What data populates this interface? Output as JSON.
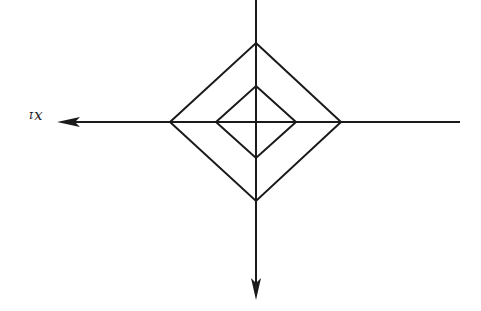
{
  "diagram": {
    "axis_label": "x₁",
    "stroke_color": "#1a1a1a",
    "background": "#ffffff",
    "center": {
      "x": 256,
      "y": 122
    },
    "horizontal_axis": {
      "x1": 460,
      "x2": 57,
      "y": 122,
      "arrow": "left"
    },
    "vertical_axis": {
      "x": 256,
      "y1": 0,
      "y2": 300,
      "arrow": "down"
    },
    "diamonds": [
      {
        "name": "outer",
        "top": [
          256,
          43
        ],
        "right": [
          341,
          122
        ],
        "bottom": [
          256,
          201
        ],
        "left": [
          170,
          122
        ]
      },
      {
        "name": "inner",
        "top": [
          256,
          86
        ],
        "right": [
          296,
          122
        ],
        "bottom": [
          256,
          158
        ],
        "left": [
          216,
          122
        ]
      }
    ]
  }
}
